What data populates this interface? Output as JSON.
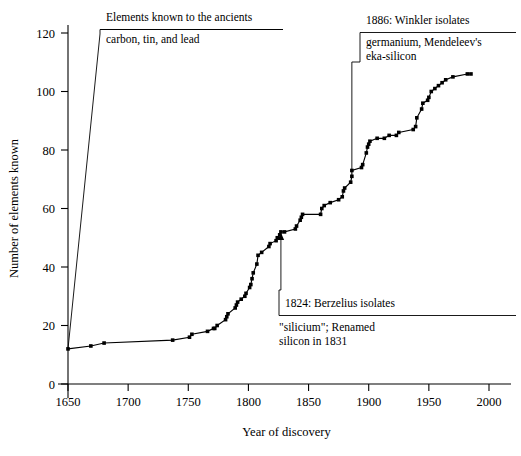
{
  "chart_data": {
    "type": "line",
    "title": "",
    "xlabel": "Year of discovery",
    "ylabel": "Number of elements known",
    "xlim": [
      1650,
      2000
    ],
    "ylim": [
      0,
      125
    ],
    "grid": false,
    "legend": "none",
    "marker": "square",
    "x_ticks": [
      1650,
      1700,
      1750,
      1800,
      1850,
      1900,
      1950,
      2000
    ],
    "x_tick_labels": [
      "1650",
      "1700",
      "1750",
      "1800",
      "1850",
      "1900",
      "1950",
      "2000"
    ],
    "y_ticks": [
      0,
      20,
      40,
      60,
      80,
      100,
      120
    ],
    "y_tick_labels": [
      "0",
      "20",
      "40",
      "60",
      "80",
      "100",
      "120"
    ],
    "series": [
      {
        "name": "Number of elements known",
        "points": [
          [
            1650,
            12
          ],
          [
            1669,
            13
          ],
          [
            1680,
            14
          ],
          [
            1737,
            15
          ],
          [
            1751,
            16
          ],
          [
            1753,
            17
          ],
          [
            1766,
            18
          ],
          [
            1771,
            19
          ],
          [
            1772,
            19
          ],
          [
            1774,
            20
          ],
          [
            1781,
            22
          ],
          [
            1782,
            23
          ],
          [
            1783,
            24
          ],
          [
            1789,
            26
          ],
          [
            1790,
            27
          ],
          [
            1791,
            28
          ],
          [
            1794,
            29
          ],
          [
            1797,
            30
          ],
          [
            1798,
            31
          ],
          [
            1801,
            33
          ],
          [
            1802,
            34
          ],
          [
            1803,
            36
          ],
          [
            1804,
            38
          ],
          [
            1807,
            41
          ],
          [
            1808,
            44
          ],
          [
            1811,
            45
          ],
          [
            1817,
            47
          ],
          [
            1818,
            48
          ],
          [
            1823,
            49
          ],
          [
            1824,
            50
          ],
          [
            1826,
            51
          ],
          [
            1827,
            52
          ],
          [
            1830,
            52
          ],
          [
            1839,
            53
          ],
          [
            1840,
            54
          ],
          [
            1843,
            56
          ],
          [
            1844,
            57
          ],
          [
            1845,
            58
          ],
          [
            1860,
            58
          ],
          [
            1861,
            60
          ],
          [
            1863,
            61
          ],
          [
            1868,
            62
          ],
          [
            1875,
            63
          ],
          [
            1878,
            64
          ],
          [
            1879,
            66
          ],
          [
            1880,
            67
          ],
          [
            1885,
            69
          ],
          [
            1886,
            71
          ],
          [
            1886,
            73
          ],
          [
            1894,
            74
          ],
          [
            1895,
            75
          ],
          [
            1898,
            79
          ],
          [
            1899,
            81
          ],
          [
            1900,
            82
          ],
          [
            1901,
            83
          ],
          [
            1907,
            84
          ],
          [
            1913,
            84
          ],
          [
            1917,
            85
          ],
          [
            1923,
            85
          ],
          [
            1925,
            86
          ],
          [
            1937,
            87
          ],
          [
            1939,
            88
          ],
          [
            1940,
            91
          ],
          [
            1944,
            94
          ],
          [
            1945,
            96
          ],
          [
            1949,
            97
          ],
          [
            1950,
            98
          ],
          [
            1952,
            100
          ],
          [
            1955,
            101
          ],
          [
            1958,
            102
          ],
          [
            1961,
            103
          ],
          [
            1964,
            104
          ],
          [
            1970,
            105
          ],
          [
            1982,
            106
          ],
          [
            1985,
            106
          ]
        ]
      }
    ],
    "annotations": [
      {
        "id": "ancients",
        "line1": "Elements known to the ancients",
        "line2": "carbon, tin, and lead",
        "anchor_year": 1650,
        "anchor_value": 12
      },
      {
        "id": "winkler",
        "line1": "1886: Winkler isolates",
        "line2": "germanium, Mendeleev's",
        "line3": "eka-silicon",
        "anchor_year": 1886,
        "anchor_value": 73
      },
      {
        "id": "berzelius",
        "line1": "1824: Berzelius isolates",
        "line2": "\"silicium\"; Renamed",
        "line3": "silicon in 1831",
        "anchor_year": 1827,
        "anchor_value": 52
      }
    ]
  },
  "colors": {
    "axis": "#000000",
    "line": "#000000",
    "marker": "#000000",
    "background": "#ffffff"
  }
}
